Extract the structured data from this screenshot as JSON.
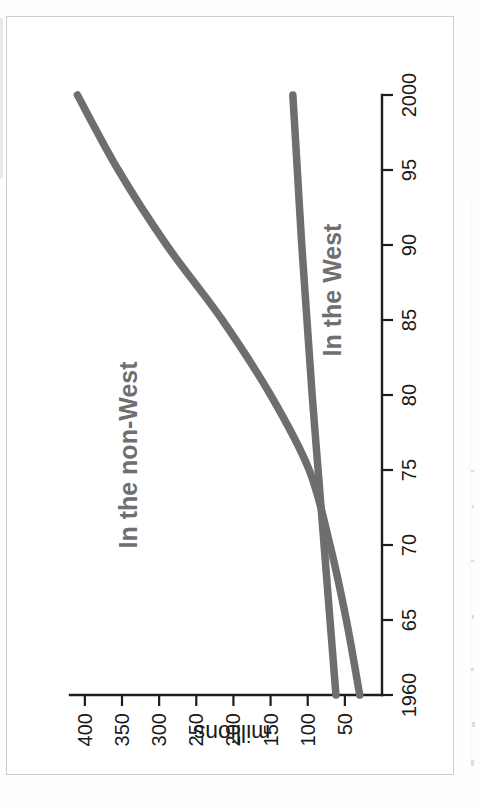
{
  "figure": {
    "rotation_degrees": -90,
    "background_color": "#ffffff",
    "frame_color": "#cdcdcd"
  },
  "chart_data": {
    "type": "line",
    "title": "",
    "subtitle": "",
    "xlabel": "",
    "ylabel": "millions",
    "xlim": [
      1960,
      2000
    ],
    "ylim": [
      0,
      420
    ],
    "grid": false,
    "legend_position": "inline-annotations",
    "x_tick_labels": [
      "1960",
      "65",
      "70",
      "75",
      "80",
      "85",
      "90",
      "95",
      "2000"
    ],
    "x_tick_values": [
      1960,
      1965,
      1970,
      1975,
      1980,
      1985,
      1990,
      1995,
      2000
    ],
    "y_tick_labels": [
      "50",
      "100",
      "150",
      "200",
      "250",
      "300",
      "350",
      "400"
    ],
    "y_tick_values": [
      50,
      100,
      150,
      200,
      250,
      300,
      350,
      400
    ],
    "x": [
      1960,
      1965,
      1970,
      1975,
      1980,
      1985,
      1990,
      1995,
      2000
    ],
    "series": [
      {
        "name": "In the non-West",
        "label": "In the non-West",
        "color": "#6e6e6e",
        "values": [
          30,
          48,
          70,
          98,
          150,
          215,
          290,
          355,
          410
        ]
      },
      {
        "name": "In the West",
        "label": "In the West",
        "color": "#6e6e6e",
        "values": [
          62,
          70,
          78,
          86,
          94,
          101,
          108,
          114,
          120
        ]
      }
    ],
    "annotations": [
      {
        "text": "In the non-West",
        "x": 1976,
        "y": 330
      },
      {
        "text": "In the West",
        "x": 1987,
        "y": 55
      }
    ]
  },
  "axes": {
    "y_axis_title": "millions",
    "tick_color": "#1d1d1d",
    "label_color": "#1a1a1a"
  }
}
